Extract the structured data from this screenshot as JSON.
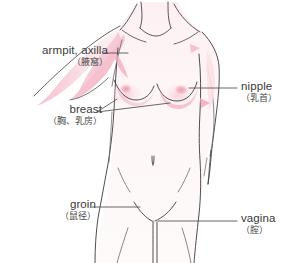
{
  "diagram": {
    "corner_artifact_text": "",
    "colors": {
      "outline": "#4a4247",
      "skin_fill": "#fdf6f7",
      "pink_light": "#fbe3e8",
      "pink_mid": "#f6c3ce",
      "pink_strong": "#f0a7b7",
      "leader_line": "#5a5458",
      "text": "#3a3a3a"
    },
    "labels": [
      {
        "id": "armpit",
        "en": "armpit, axilla",
        "ja": "（腋窩）",
        "side": "left",
        "leader": {
          "x1": 104,
          "y1": 53,
          "x2": 128,
          "y2": 53
        }
      },
      {
        "id": "breast",
        "en": "breast",
        "ja": "（胸、乳房）",
        "side": "left",
        "leader_fan": [
          {
            "x1": 97,
            "y1": 112,
            "x2": 117,
            "y2": 99
          },
          {
            "x1": 97,
            "y1": 112,
            "x2": 170,
            "y2": 103
          }
        ]
      },
      {
        "id": "nipple",
        "en": "nipple",
        "ja": "（乳首）",
        "side": "right",
        "leader": {
          "x1": 237,
          "y1": 88,
          "x2": 189,
          "y2": 88
        }
      },
      {
        "id": "groin",
        "en": "groin",
        "ja": "（鼠径）",
        "side": "left",
        "leader": {
          "x1": 92,
          "y1": 207,
          "x2": 140,
          "y2": 207
        }
      },
      {
        "id": "vagina",
        "en": "vagina",
        "ja": "（腟）",
        "side": "right",
        "leader": {
          "x1": 237,
          "y1": 221,
          "x2": 158,
          "y2": 221
        }
      }
    ]
  }
}
